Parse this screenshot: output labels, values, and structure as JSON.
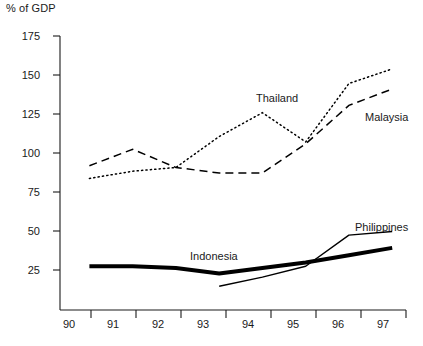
{
  "chart_data": {
    "type": "line",
    "title": "",
    "ylabel": "% of GDP",
    "xlabel": "",
    "ylim": [
      25,
      175
    ],
    "yticks": [
      25,
      50,
      75,
      100,
      125,
      150,
      175
    ],
    "grid": false,
    "legend": "inline-labels",
    "categories": [
      "90",
      "91",
      "92",
      "93",
      "94",
      "95",
      "96",
      "97"
    ],
    "series": [
      {
        "name": "Thailand",
        "style": "dotted",
        "color": "#000000",
        "x": [
          "90",
          "91",
          "92",
          "93",
          "94",
          "95",
          "96",
          "97"
        ],
        "values": [
          97,
          101,
          103,
          120,
          133,
          117,
          149,
          157
        ]
      },
      {
        "name": "Malaysia",
        "style": "dashed",
        "color": "#000000",
        "x": [
          "90",
          "91",
          "92",
          "93",
          "94",
          "95",
          "96",
          "97"
        ],
        "values": [
          104,
          113,
          103,
          100,
          100,
          116,
          137,
          146
        ]
      },
      {
        "name": "Indonesia",
        "style": "solid-thick",
        "color": "#000000",
        "x": [
          "90",
          "91",
          "92",
          "93",
          "94",
          "95",
          "96",
          "97"
        ],
        "values": [
          49,
          49,
          48,
          45,
          48,
          51,
          55,
          59
        ]
      },
      {
        "name": "Philippines",
        "style": "solid-thin",
        "color": "#000000",
        "x": [
          "93",
          "94",
          "95",
          "96",
          "97"
        ],
        "values": [
          38,
          43,
          49,
          66,
          68
        ]
      }
    ],
    "annotations": [
      {
        "text": "Thailand",
        "series": "Thailand"
      },
      {
        "text": "Malaysia",
        "series": "Malaysia"
      },
      {
        "text": "Indonesia",
        "series": "Indonesia"
      },
      {
        "text": "Philippines",
        "series": "Philippines"
      }
    ]
  },
  "labels": {
    "axis_title": "% of GDP",
    "y": [
      "175",
      "150",
      "125",
      "100",
      "75",
      "50",
      "25"
    ],
    "x": [
      "90",
      "91",
      "92",
      "93",
      "94",
      "95",
      "96",
      "97"
    ],
    "thailand": "Thailand",
    "malaysia": "Malaysia",
    "indonesia": "Indonesia",
    "philippines": "Philippines"
  }
}
